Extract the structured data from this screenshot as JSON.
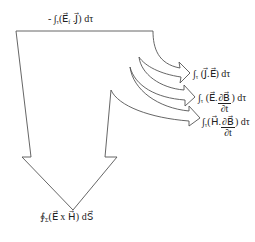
{
  "diagram": {
    "type": "energy-flow-arrow-diagram",
    "stroke_color": "#555555",
    "fill_color": "#ffffff",
    "labels": {
      "top": {
        "prefix": "- ∫",
        "sub": "τ",
        "body": "(E⃗",
        "sub2": "f",
        "body2": " .J⃗) dτ"
      },
      "branch1": {
        "prefix": "∫",
        "sub": "τ",
        "body": " (J⃗.E⃗) dτ"
      },
      "branch2": {
        "prefix": "∫",
        "sub": "τ",
        "body_before": " (E⃗.",
        "num": "∂B⃗",
        "den": "∂t",
        "body_after": ") dτ"
      },
      "branch3": {
        "prefix": "∫",
        "sub": "τ",
        "body_before": "(H⃗.",
        "num": "∂B⃗",
        "den": "∂t",
        "body_after": ") dτ"
      },
      "bottom": {
        "prefix": "∮",
        "sub": "Σ",
        "body": "(E⃗ x H⃗) dS⃗"
      }
    }
  }
}
